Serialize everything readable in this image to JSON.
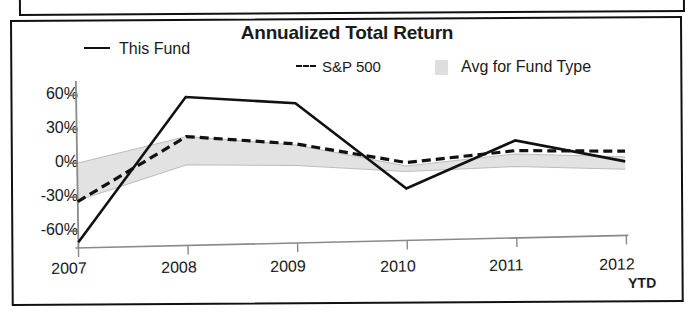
{
  "chart_data": {
    "type": "line",
    "title": "Annualized Total Return",
    "xlabel": "",
    "ylabel": "",
    "x": [
      "2007",
      "2008",
      "2009",
      "2010",
      "2011",
      "2012"
    ],
    "x_note": "YTD",
    "ylim": [
      -75,
      70
    ],
    "yticks": [
      60,
      30,
      0,
      -30,
      -60
    ],
    "ytick_labels": [
      "60%",
      "30%",
      "0%",
      "-30%",
      "-60%"
    ],
    "grid": false,
    "legend_position": "top",
    "series": [
      {
        "name": "This Fund",
        "style": "solid",
        "color": "#111111",
        "values": [
          -70,
          57,
          50,
          -27,
          14,
          -6
        ]
      },
      {
        "name": "S&P 500",
        "style": "dashed",
        "color": "#111111",
        "values": [
          -34,
          22,
          14,
          -4,
          5,
          3
        ]
      },
      {
        "name": "Avg for Fund Type",
        "style": "band",
        "color": "#dedede",
        "band_upper": [
          0,
          22,
          13,
          -7,
          2,
          -2
        ],
        "band_lower": [
          -33,
          -3,
          -5,
          -12,
          -9,
          -13
        ]
      }
    ]
  },
  "chart": {
    "title": "Annualized Total Return",
    "legend": [
      {
        "label": "This Fund",
        "marker": "solid-line-swatch"
      },
      {
        "label": "S&P 500",
        "marker": "dashed-line-swatch"
      },
      {
        "label": "Avg for Fund Type",
        "marker": "gray-band-swatch"
      }
    ],
    "y_axis": {
      "ticks": [
        "60%",
        "30%",
        "0%",
        "-30%",
        "-60%"
      ]
    },
    "x_axis": {
      "ticks": [
        "2007",
        "2008",
        "2009",
        "2010",
        "2011",
        "2012"
      ],
      "suffix": "YTD"
    }
  }
}
